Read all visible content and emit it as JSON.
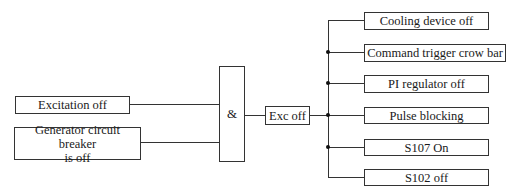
{
  "inputs": [
    {
      "label": "Excitation off"
    },
    {
      "label_line1": "Generator circuit breaker",
      "label_line2": "is off"
    }
  ],
  "gate": {
    "symbol": "&"
  },
  "intermediate": {
    "label": "Exc off"
  },
  "outputs": [
    {
      "label": "Cooling device off"
    },
    {
      "label": "Command trigger crow bar"
    },
    {
      "label": "PI regulator off"
    },
    {
      "label": "Pulse blocking"
    },
    {
      "label": "S107 On"
    },
    {
      "label": "S102 off"
    }
  ]
}
